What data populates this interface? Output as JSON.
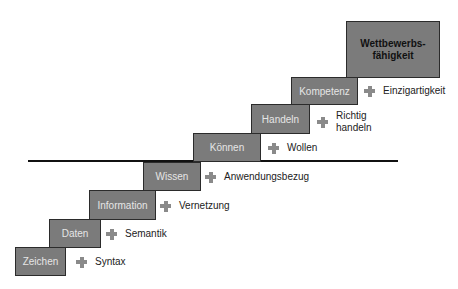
{
  "diagram": {
    "top": "Wettbewerbsfähigkeit",
    "top_lines": [
      "Wettbewerbs-",
      "fähigkeit"
    ],
    "steps": [
      {
        "label": "Zeichen",
        "addition": "Syntax"
      },
      {
        "label": "Daten",
        "addition": "Semantik"
      },
      {
        "label": "Information",
        "addition": "Vernetzung"
      },
      {
        "label": "Wissen",
        "addition": "Anwendungsbezug"
      },
      {
        "label": "Können",
        "addition": "Wollen"
      },
      {
        "label": "Handeln",
        "addition_lines": [
          "Richtig",
          "handeln"
        ]
      },
      {
        "label": "Kompetenz",
        "addition": "Einzigartigkeit"
      }
    ],
    "icon": "plus-icon",
    "colors": {
      "step_fill": "#7b7b7b",
      "step_border": "#2b2b2b",
      "step_text": "#e6e6e6",
      "plus": "#8a8a8a"
    }
  }
}
